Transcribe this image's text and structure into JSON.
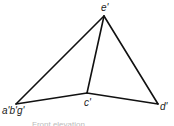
{
  "diagram": {
    "labels": {
      "e": "e'",
      "abg": "a'b'g'",
      "c": "c'",
      "d": "d'"
    },
    "edges": [
      {
        "from": "abg",
        "to": "e"
      },
      {
        "from": "e",
        "to": "d"
      },
      {
        "from": "e",
        "to": "c"
      },
      {
        "from": "abg",
        "to": "c"
      },
      {
        "from": "c",
        "to": "d"
      }
    ],
    "caption": "Front elevation"
  }
}
